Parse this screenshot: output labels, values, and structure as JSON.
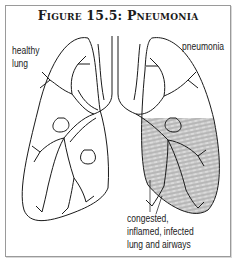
{
  "figure": {
    "title": "Figure 15.5: Pneumonia",
    "labels": {
      "healthy_line1": "healthy",
      "healthy_line2": "lung",
      "pneumonia": "pneumonia",
      "infected_line1": "congested,",
      "infected_line2": "inflamed, infected",
      "infected_line3": "lung and airways"
    },
    "colors": {
      "outline": "#1a1a1a",
      "shading": "#8a8a8a",
      "frame": "#9a9a9a"
    }
  }
}
